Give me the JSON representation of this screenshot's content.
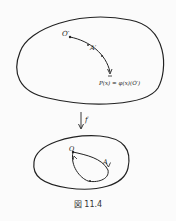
{
  "figure": {
    "caption": "図 11.4",
    "top_region": {
      "point_start": "O′",
      "path_label": "A′",
      "point_end": "P(x) = φ(x)(O′)"
    },
    "map": {
      "label": "f"
    },
    "bottom_region": {
      "point": "O",
      "loop_label": "A"
    }
  }
}
